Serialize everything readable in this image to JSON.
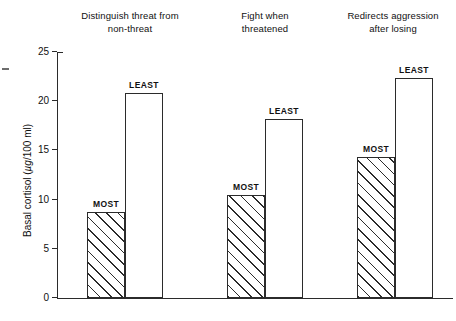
{
  "chart_data": {
    "type": "bar",
    "title": "",
    "xlabel": "",
    "ylabel": "Basal cortisol (µg/100 ml)",
    "ylabel_prefix": "Basal cortisol (",
    "ylabel_unit": "µg",
    "ylabel_suffix": "/100 ml)",
    "ylim": [
      0,
      25
    ],
    "yticks": [
      0,
      5,
      10,
      15,
      20,
      25
    ],
    "ytick_labels": [
      "0",
      "5",
      "10",
      "15",
      "20",
      "25"
    ],
    "grid": false,
    "legend": "none",
    "series_names": [
      "MOST",
      "LEAST"
    ],
    "categories": [
      "Distinguish threat from non-threat",
      "Fight when threatened",
      "Redirects aggression after losing"
    ],
    "series": [
      {
        "name": "MOST",
        "values": [
          8.7,
          10.5,
          14.3
        ]
      },
      {
        "name": "LEAST",
        "values": [
          20.8,
          18.2,
          22.4
        ]
      }
    ],
    "groups": [
      {
        "title_line1": "Distinguish threat from",
        "title_line2": "non-threat",
        "bars": [
          {
            "label": "MOST",
            "value": 8.7,
            "style": "hatched"
          },
          {
            "label": "LEAST",
            "value": 20.8,
            "style": "open"
          }
        ]
      },
      {
        "title_line1": "Fight when",
        "title_line2": "threatened",
        "bars": [
          {
            "label": "MOST",
            "value": 10.5,
            "style": "hatched"
          },
          {
            "label": "LEAST",
            "value": 18.2,
            "style": "open"
          }
        ]
      },
      {
        "title_line1": "Redirects aggression",
        "title_line2": "after losing",
        "bars": [
          {
            "label": "MOST",
            "value": 14.3,
            "style": "hatched"
          },
          {
            "label": "LEAST",
            "value": 22.4,
            "style": "open"
          }
        ]
      }
    ],
    "colors": {
      "ink": "#2b2b2b",
      "bar_fill": "#ffffff",
      "hatch": "#2b2b2b",
      "background": "#ffffff"
    }
  }
}
